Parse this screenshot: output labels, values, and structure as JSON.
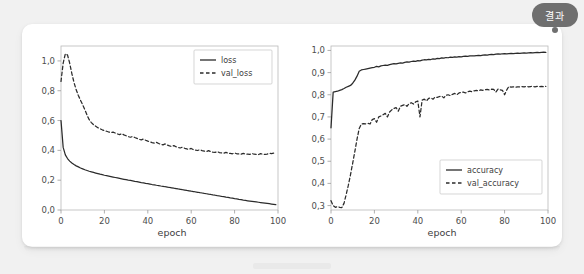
{
  "badge": {
    "label": "결과",
    "color": "#6f6f6f"
  },
  "card": {
    "background": "#ffffff"
  },
  "chart_data": [
    {
      "type": "line",
      "id": "loss-chart",
      "title": "",
      "xlabel": "epoch",
      "ylabel": "",
      "xlim": [
        0,
        100
      ],
      "ylim": [
        0.0,
        1.1
      ],
      "xticks": [
        0,
        20,
        40,
        60,
        80,
        100
      ],
      "xticklabels": [
        "0",
        "20",
        "40",
        "60",
        "80",
        "100"
      ],
      "yticks": [
        0.0,
        0.2,
        0.4,
        0.6,
        0.8,
        1.0
      ],
      "yticklabels": [
        "0,0",
        "0,2",
        "0,4",
        "0,6",
        "0,8",
        "1,0"
      ],
      "grid": false,
      "legend_position": "top-right",
      "x": [
        0,
        1,
        2,
        3,
        4,
        5,
        6,
        7,
        8,
        9,
        10,
        11,
        12,
        13,
        14,
        15,
        16,
        17,
        18,
        19,
        20,
        21,
        22,
        23,
        24,
        25,
        26,
        27,
        28,
        29,
        30,
        31,
        32,
        33,
        34,
        35,
        36,
        37,
        38,
        39,
        40,
        41,
        42,
        43,
        44,
        45,
        46,
        47,
        48,
        49,
        50,
        51,
        52,
        53,
        54,
        55,
        56,
        57,
        58,
        59,
        60,
        61,
        62,
        63,
        64,
        65,
        66,
        67,
        68,
        69,
        70,
        71,
        72,
        73,
        74,
        75,
        76,
        77,
        78,
        79,
        80,
        81,
        82,
        83,
        84,
        85,
        86,
        87,
        88,
        89,
        90,
        91,
        92,
        93,
        94,
        95,
        96,
        97,
        98,
        99
      ],
      "series": [
        {
          "name": "loss",
          "style": "solid",
          "color": "#2b2b2b",
          "values": [
            0.6,
            0.42,
            0.37,
            0.345,
            0.328,
            0.315,
            0.305,
            0.296,
            0.289,
            0.282,
            0.276,
            0.27,
            0.265,
            0.26,
            0.256,
            0.252,
            0.248,
            0.244,
            0.24,
            0.237,
            0.233,
            0.23,
            0.227,
            0.224,
            0.221,
            0.218,
            0.215,
            0.212,
            0.209,
            0.206,
            0.203,
            0.2,
            0.198,
            0.195,
            0.192,
            0.19,
            0.187,
            0.184,
            0.182,
            0.179,
            0.177,
            0.174,
            0.171,
            0.169,
            0.166,
            0.164,
            0.161,
            0.159,
            0.156,
            0.154,
            0.151,
            0.149,
            0.146,
            0.144,
            0.141,
            0.139,
            0.136,
            0.134,
            0.131,
            0.129,
            0.126,
            0.124,
            0.121,
            0.119,
            0.116,
            0.114,
            0.111,
            0.109,
            0.106,
            0.104,
            0.101,
            0.099,
            0.096,
            0.094,
            0.091,
            0.089,
            0.086,
            0.084,
            0.081,
            0.079,
            0.076,
            0.074,
            0.071,
            0.069,
            0.066,
            0.064,
            0.062,
            0.06,
            0.058,
            0.056,
            0.054,
            0.052,
            0.05,
            0.048,
            0.046,
            0.044,
            0.042,
            0.04,
            0.038,
            0.036
          ]
        },
        {
          "name": "val_loss",
          "style": "dashed",
          "color": "#2b2b2b",
          "values": [
            0.862,
            0.985,
            1.048,
            1.04,
            0.985,
            0.915,
            0.855,
            0.806,
            0.768,
            0.736,
            0.705,
            0.672,
            0.636,
            0.606,
            0.586,
            0.572,
            0.562,
            0.552,
            0.545,
            0.538,
            0.533,
            0.528,
            0.523,
            0.519,
            0.522,
            0.516,
            0.51,
            0.506,
            0.512,
            0.504,
            0.498,
            0.492,
            0.488,
            0.493,
            0.486,
            0.48,
            0.474,
            0.47,
            0.476,
            0.468,
            0.462,
            0.457,
            0.452,
            0.448,
            0.454,
            0.446,
            0.441,
            0.437,
            0.443,
            0.435,
            0.43,
            0.426,
            0.432,
            0.424,
            0.42,
            0.416,
            0.422,
            0.414,
            0.41,
            0.407,
            0.413,
            0.405,
            0.402,
            0.399,
            0.405,
            0.398,
            0.395,
            0.392,
            0.398,
            0.391,
            0.388,
            0.386,
            0.392,
            0.385,
            0.383,
            0.381,
            0.387,
            0.38,
            0.379,
            0.377,
            0.383,
            0.377,
            0.376,
            0.374,
            0.38,
            0.375,
            0.374,
            0.373,
            0.379,
            0.374,
            0.373,
            0.372,
            0.378,
            0.374,
            0.373,
            0.375,
            0.38,
            0.378,
            0.381,
            0.385
          ]
        }
      ]
    },
    {
      "type": "line",
      "id": "accuracy-chart",
      "title": "",
      "xlabel": "epoch",
      "ylabel": "",
      "xlim": [
        0,
        100
      ],
      "ylim": [
        0.28,
        1.02
      ],
      "xticks": [
        0,
        20,
        40,
        60,
        80,
        100
      ],
      "xticklabels": [
        "0",
        "20",
        "40",
        "60",
        "80",
        "100"
      ],
      "yticks": [
        0.3,
        0.4,
        0.5,
        0.6,
        0.7,
        0.8,
        0.9,
        1.0
      ],
      "yticklabels": [
        "0,3",
        "0,4",
        "0,5",
        "0,6",
        "0,7",
        "0,8",
        "0,9",
        "1,0"
      ],
      "grid": false,
      "legend_position": "bottom-right",
      "x": [
        0,
        1,
        2,
        3,
        4,
        5,
        6,
        7,
        8,
        9,
        10,
        11,
        12,
        13,
        14,
        15,
        16,
        17,
        18,
        19,
        20,
        21,
        22,
        23,
        24,
        25,
        26,
        27,
        28,
        29,
        30,
        31,
        32,
        33,
        34,
        35,
        36,
        37,
        38,
        39,
        40,
        41,
        42,
        43,
        44,
        45,
        46,
        47,
        48,
        49,
        50,
        51,
        52,
        53,
        54,
        55,
        56,
        57,
        58,
        59,
        60,
        61,
        62,
        63,
        64,
        65,
        66,
        67,
        68,
        69,
        70,
        71,
        72,
        73,
        74,
        75,
        76,
        77,
        78,
        79,
        80,
        81,
        82,
        83,
        84,
        85,
        86,
        87,
        88,
        89,
        90,
        91,
        92,
        93,
        94,
        95,
        96,
        97,
        98,
        99
      ],
      "series": [
        {
          "name": "accuracy",
          "style": "solid",
          "color": "#2b2b2b",
          "values": [
            0.651,
            0.812,
            0.814,
            0.816,
            0.82,
            0.823,
            0.828,
            0.834,
            0.838,
            0.842,
            0.852,
            0.866,
            0.884,
            0.906,
            0.912,
            0.914,
            0.916,
            0.918,
            0.92,
            0.922,
            0.924,
            0.928,
            0.926,
            0.93,
            0.932,
            0.934,
            0.933,
            0.936,
            0.938,
            0.94,
            0.939,
            0.942,
            0.944,
            0.943,
            0.946,
            0.948,
            0.947,
            0.95,
            0.952,
            0.951,
            0.954,
            0.953,
            0.956,
            0.958,
            0.957,
            0.96,
            0.959,
            0.962,
            0.961,
            0.964,
            0.963,
            0.966,
            0.965,
            0.968,
            0.967,
            0.97,
            0.969,
            0.971,
            0.97,
            0.972,
            0.971,
            0.973,
            0.974,
            0.973,
            0.975,
            0.976,
            0.975,
            0.977,
            0.978,
            0.977,
            0.979,
            0.98,
            0.979,
            0.981,
            0.982,
            0.981,
            0.983,
            0.984,
            0.983,
            0.985,
            0.986,
            0.985,
            0.986,
            0.987,
            0.986,
            0.987,
            0.988,
            0.987,
            0.988,
            0.989,
            0.988,
            0.989,
            0.99,
            0.989,
            0.99,
            0.991,
            0.99,
            0.991,
            0.992,
            0.991
          ]
        },
        {
          "name": "val_accuracy",
          "style": "dashed",
          "color": "#2b2b2b",
          "values": [
            0.322,
            0.3,
            0.292,
            0.296,
            0.292,
            0.291,
            0.31,
            0.35,
            0.392,
            0.44,
            0.492,
            0.545,
            0.6,
            0.648,
            0.668,
            0.67,
            0.669,
            0.671,
            0.668,
            0.688,
            0.692,
            0.676,
            0.7,
            0.704,
            0.71,
            0.716,
            0.7,
            0.722,
            0.732,
            0.738,
            0.742,
            0.726,
            0.748,
            0.752,
            0.756,
            0.748,
            0.76,
            0.764,
            0.758,
            0.768,
            0.772,
            0.7,
            0.776,
            0.78,
            0.772,
            0.784,
            0.786,
            0.78,
            0.79,
            0.788,
            0.792,
            0.794,
            0.786,
            0.798,
            0.8,
            0.796,
            0.802,
            0.806,
            0.8,
            0.808,
            0.81,
            0.812,
            0.808,
            0.814,
            0.816,
            0.814,
            0.818,
            0.82,
            0.818,
            0.822,
            0.82,
            0.823,
            0.824,
            0.822,
            0.825,
            0.824,
            0.812,
            0.826,
            0.822,
            0.82,
            0.8,
            0.822,
            0.838,
            0.834,
            0.836,
            0.834,
            0.836,
            0.835,
            0.837,
            0.836,
            0.838,
            0.836,
            0.837,
            0.838,
            0.836,
            0.838,
            0.837,
            0.838,
            0.836,
            0.838
          ]
        }
      ]
    }
  ]
}
